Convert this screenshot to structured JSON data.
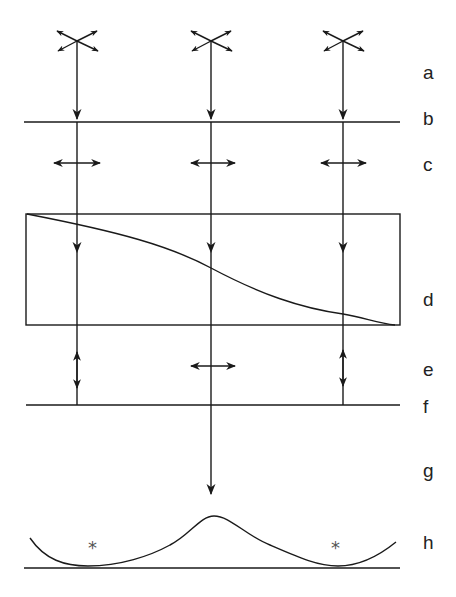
{
  "diagram": {
    "type": "polarized-light-optical-path",
    "stroke_color": "#1a1a1a",
    "labels": [
      {
        "id": "a",
        "text": "a",
        "y": 63
      },
      {
        "id": "b",
        "text": "b",
        "y": 109
      },
      {
        "id": "c",
        "text": "c",
        "y": 155
      },
      {
        "id": "d",
        "text": "d",
        "y": 290
      },
      {
        "id": "e",
        "text": "e",
        "y": 360
      },
      {
        "id": "f",
        "text": "f",
        "y": 397
      },
      {
        "id": "g",
        "text": "g",
        "y": 461
      },
      {
        "id": "h",
        "text": "h",
        "y": 533
      }
    ],
    "beams_x": [
      77,
      211,
      343
    ],
    "markers": [
      {
        "id": "left-star",
        "text": "*",
        "x": 88,
        "y": 539
      },
      {
        "id": "right-star",
        "text": "*",
        "x": 331,
        "y": 539
      }
    ]
  }
}
